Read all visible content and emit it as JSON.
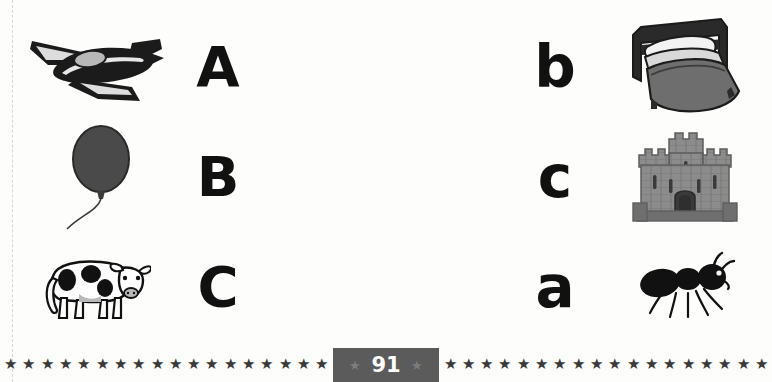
{
  "page": {
    "number": "91",
    "background_color": "#fdfdfc",
    "ink_color": "#111111"
  },
  "exercise": {
    "left_column": [
      {
        "picture_name": "airplane",
        "picture_label": "airplane",
        "letter": "A",
        "letter_case": "uppercase"
      },
      {
        "picture_name": "balloon",
        "picture_label": "balloon",
        "letter": "B",
        "letter_case": "uppercase"
      },
      {
        "picture_name": "cow",
        "picture_label": "cow",
        "letter": "C",
        "letter_case": "uppercase"
      }
    ],
    "right_column": [
      {
        "letter": "b",
        "letter_case": "lowercase",
        "picture_name": "bed",
        "picture_label": "bed"
      },
      {
        "letter": "c",
        "letter_case": "lowercase",
        "picture_name": "castle",
        "picture_label": "castle"
      },
      {
        "letter": "a",
        "letter_case": "lowercase",
        "picture_name": "ant",
        "picture_label": "ant"
      }
    ]
  },
  "footer": {
    "star_glyph": "★",
    "star_count": 42,
    "star_color": "#3a3a3a",
    "badge_color": "#5b5b5b",
    "badge_star_glyph": "★",
    "badge_text_color": "#ffffff"
  },
  "colors": {
    "airplane_body": "#1b1b1b",
    "airplane_canopy": "#b8b8b8",
    "balloon_fill": "#4a4a4a",
    "balloon_string": "#3a3a3a",
    "cow_body": "#ffffff",
    "cow_spots": "#111111",
    "cow_shade": "#b9b9b9",
    "bed_frame": "#2a2a2a",
    "bed_pillow": "#f2f2f2",
    "bed_blanket": "#6e6e6e",
    "castle_stone": "#8c8c8c",
    "castle_stone_dark": "#6f6f6f",
    "castle_gate": "#3a3a3a",
    "ant_body": "#111111"
  }
}
